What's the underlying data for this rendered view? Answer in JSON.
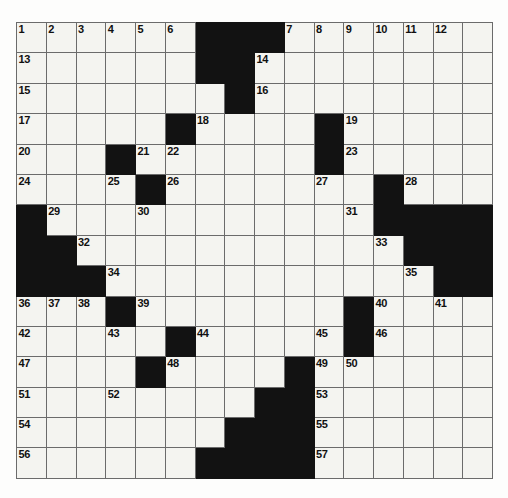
{
  "puzzle": {
    "title": "Crossword Grid",
    "columns": 16,
    "rows": 15,
    "colors": {
      "block": "#121212",
      "cell": "#f4f4f0",
      "grid_line": "#6b6b6b",
      "number_text": "#101010",
      "page_background": "#fdfdfc"
    },
    "numbers_visible": [
      1,
      2,
      3,
      4,
      5,
      6,
      7,
      8,
      9,
      10,
      11,
      12,
      13,
      14,
      15,
      16,
      17,
      18,
      19,
      20,
      21,
      22,
      23,
      24,
      25,
      26,
      27,
      28,
      29,
      30,
      31,
      32,
      33,
      34,
      35,
      36,
      37,
      38,
      39,
      40,
      41,
      42,
      43,
      44,
      45,
      46,
      47,
      48,
      49,
      50,
      51,
      52,
      53,
      54,
      55,
      56,
      57
    ],
    "grid": [
      [
        {
          "block": false,
          "num": "1"
        },
        {
          "block": false,
          "num": "2"
        },
        {
          "block": false,
          "num": "3"
        },
        {
          "block": false,
          "num": "4"
        },
        {
          "block": false,
          "num": "5"
        },
        {
          "block": false,
          "num": "6"
        },
        {
          "block": true,
          "num": ""
        },
        {
          "block": true,
          "num": ""
        },
        {
          "block": true,
          "num": ""
        },
        {
          "block": false,
          "num": "7"
        },
        {
          "block": false,
          "num": "8"
        },
        {
          "block": false,
          "num": "9"
        },
        {
          "block": false,
          "num": "10"
        },
        {
          "block": false,
          "num": "11"
        },
        {
          "block": false,
          "num": "12"
        },
        {
          "block": false,
          "num": ""
        }
      ],
      [
        {
          "block": false,
          "num": "13"
        },
        {
          "block": false,
          "num": ""
        },
        {
          "block": false,
          "num": ""
        },
        {
          "block": false,
          "num": ""
        },
        {
          "block": false,
          "num": ""
        },
        {
          "block": false,
          "num": ""
        },
        {
          "block": true,
          "num": ""
        },
        {
          "block": true,
          "num": ""
        },
        {
          "block": false,
          "num": "14"
        },
        {
          "block": false,
          "num": ""
        },
        {
          "block": false,
          "num": ""
        },
        {
          "block": false,
          "num": ""
        },
        {
          "block": false,
          "num": ""
        },
        {
          "block": false,
          "num": ""
        },
        {
          "block": false,
          "num": ""
        },
        {
          "block": false,
          "num": ""
        }
      ],
      [
        {
          "block": false,
          "num": "15"
        },
        {
          "block": false,
          "num": ""
        },
        {
          "block": false,
          "num": ""
        },
        {
          "block": false,
          "num": ""
        },
        {
          "block": false,
          "num": ""
        },
        {
          "block": false,
          "num": ""
        },
        {
          "block": false,
          "num": ""
        },
        {
          "block": true,
          "num": ""
        },
        {
          "block": false,
          "num": "16"
        },
        {
          "block": false,
          "num": ""
        },
        {
          "block": false,
          "num": ""
        },
        {
          "block": false,
          "num": ""
        },
        {
          "block": false,
          "num": ""
        },
        {
          "block": false,
          "num": ""
        },
        {
          "block": false,
          "num": ""
        },
        {
          "block": false,
          "num": ""
        }
      ],
      [
        {
          "block": false,
          "num": "17"
        },
        {
          "block": false,
          "num": ""
        },
        {
          "block": false,
          "num": ""
        },
        {
          "block": false,
          "num": ""
        },
        {
          "block": false,
          "num": ""
        },
        {
          "block": true,
          "num": ""
        },
        {
          "block": false,
          "num": "18"
        },
        {
          "block": false,
          "num": ""
        },
        {
          "block": false,
          "num": ""
        },
        {
          "block": false,
          "num": ""
        },
        {
          "block": true,
          "num": ""
        },
        {
          "block": false,
          "num": "19"
        },
        {
          "block": false,
          "num": ""
        },
        {
          "block": false,
          "num": ""
        },
        {
          "block": false,
          "num": ""
        },
        {
          "block": false,
          "num": ""
        }
      ],
      [
        {
          "block": false,
          "num": "20"
        },
        {
          "block": false,
          "num": ""
        },
        {
          "block": false,
          "num": ""
        },
        {
          "block": true,
          "num": ""
        },
        {
          "block": false,
          "num": "21"
        },
        {
          "block": false,
          "num": "22"
        },
        {
          "block": false,
          "num": ""
        },
        {
          "block": false,
          "num": ""
        },
        {
          "block": false,
          "num": ""
        },
        {
          "block": false,
          "num": ""
        },
        {
          "block": true,
          "num": ""
        },
        {
          "block": false,
          "num": "23"
        },
        {
          "block": false,
          "num": ""
        },
        {
          "block": false,
          "num": ""
        },
        {
          "block": false,
          "num": ""
        },
        {
          "block": false,
          "num": ""
        }
      ],
      [
        {
          "block": false,
          "num": "24"
        },
        {
          "block": false,
          "num": ""
        },
        {
          "block": false,
          "num": ""
        },
        {
          "block": false,
          "num": "25"
        },
        {
          "block": true,
          "num": ""
        },
        {
          "block": false,
          "num": "26"
        },
        {
          "block": false,
          "num": ""
        },
        {
          "block": false,
          "num": ""
        },
        {
          "block": false,
          "num": ""
        },
        {
          "block": false,
          "num": ""
        },
        {
          "block": false,
          "num": "27"
        },
        {
          "block": false,
          "num": ""
        },
        {
          "block": true,
          "num": ""
        },
        {
          "block": false,
          "num": "28"
        },
        {
          "block": false,
          "num": ""
        },
        {
          "block": false,
          "num": ""
        }
      ],
      [
        {
          "block": true,
          "num": ""
        },
        {
          "block": false,
          "num": "29"
        },
        {
          "block": false,
          "num": ""
        },
        {
          "block": false,
          "num": ""
        },
        {
          "block": false,
          "num": "30"
        },
        {
          "block": false,
          "num": ""
        },
        {
          "block": false,
          "num": ""
        },
        {
          "block": false,
          "num": ""
        },
        {
          "block": false,
          "num": ""
        },
        {
          "block": false,
          "num": ""
        },
        {
          "block": false,
          "num": ""
        },
        {
          "block": false,
          "num": "31"
        },
        {
          "block": true,
          "num": ""
        },
        {
          "block": true,
          "num": ""
        },
        {
          "block": true,
          "num": ""
        },
        {
          "block": true,
          "num": ""
        }
      ],
      [
        {
          "block": true,
          "num": ""
        },
        {
          "block": true,
          "num": ""
        },
        {
          "block": false,
          "num": "32"
        },
        {
          "block": false,
          "num": ""
        },
        {
          "block": false,
          "num": ""
        },
        {
          "block": false,
          "num": ""
        },
        {
          "block": false,
          "num": ""
        },
        {
          "block": false,
          "num": ""
        },
        {
          "block": false,
          "num": ""
        },
        {
          "block": false,
          "num": ""
        },
        {
          "block": false,
          "num": ""
        },
        {
          "block": false,
          "num": ""
        },
        {
          "block": false,
          "num": "33"
        },
        {
          "block": true,
          "num": ""
        },
        {
          "block": true,
          "num": ""
        },
        {
          "block": true,
          "num": ""
        }
      ],
      [
        {
          "block": true,
          "num": ""
        },
        {
          "block": true,
          "num": ""
        },
        {
          "block": true,
          "num": ""
        },
        {
          "block": false,
          "num": "34"
        },
        {
          "block": false,
          "num": ""
        },
        {
          "block": false,
          "num": ""
        },
        {
          "block": false,
          "num": ""
        },
        {
          "block": false,
          "num": ""
        },
        {
          "block": false,
          "num": ""
        },
        {
          "block": false,
          "num": ""
        },
        {
          "block": false,
          "num": ""
        },
        {
          "block": false,
          "num": ""
        },
        {
          "block": false,
          "num": ""
        },
        {
          "block": false,
          "num": "35"
        },
        {
          "block": true,
          "num": ""
        },
        {
          "block": true,
          "num": ""
        }
      ],
      [
        {
          "block": false,
          "num": "36"
        },
        {
          "block": false,
          "num": "37"
        },
        {
          "block": false,
          "num": "38"
        },
        {
          "block": true,
          "num": ""
        },
        {
          "block": false,
          "num": "39"
        },
        {
          "block": false,
          "num": ""
        },
        {
          "block": false,
          "num": ""
        },
        {
          "block": false,
          "num": ""
        },
        {
          "block": false,
          "num": ""
        },
        {
          "block": false,
          "num": ""
        },
        {
          "block": false,
          "num": ""
        },
        {
          "block": true,
          "num": ""
        },
        {
          "block": false,
          "num": "40"
        },
        {
          "block": false,
          "num": ""
        },
        {
          "block": false,
          "num": "41"
        },
        {
          "block": false,
          "num": ""
        }
      ],
      [
        {
          "block": false,
          "num": "42"
        },
        {
          "block": false,
          "num": ""
        },
        {
          "block": false,
          "num": ""
        },
        {
          "block": false,
          "num": "43"
        },
        {
          "block": false,
          "num": ""
        },
        {
          "block": true,
          "num": ""
        },
        {
          "block": false,
          "num": "44"
        },
        {
          "block": false,
          "num": ""
        },
        {
          "block": false,
          "num": ""
        },
        {
          "block": false,
          "num": ""
        },
        {
          "block": false,
          "num": "45"
        },
        {
          "block": true,
          "num": ""
        },
        {
          "block": false,
          "num": "46"
        },
        {
          "block": false,
          "num": ""
        },
        {
          "block": false,
          "num": ""
        },
        {
          "block": false,
          "num": ""
        }
      ],
      [
        {
          "block": false,
          "num": "47"
        },
        {
          "block": false,
          "num": ""
        },
        {
          "block": false,
          "num": ""
        },
        {
          "block": false,
          "num": ""
        },
        {
          "block": true,
          "num": ""
        },
        {
          "block": false,
          "num": "48"
        },
        {
          "block": false,
          "num": ""
        },
        {
          "block": false,
          "num": ""
        },
        {
          "block": false,
          "num": ""
        },
        {
          "block": true,
          "num": ""
        },
        {
          "block": false,
          "num": "49"
        },
        {
          "block": false,
          "num": "50"
        },
        {
          "block": false,
          "num": ""
        },
        {
          "block": false,
          "num": ""
        },
        {
          "block": false,
          "num": ""
        },
        {
          "block": false,
          "num": ""
        }
      ],
      [
        {
          "block": false,
          "num": "51"
        },
        {
          "block": false,
          "num": ""
        },
        {
          "block": false,
          "num": ""
        },
        {
          "block": false,
          "num": "52"
        },
        {
          "block": false,
          "num": ""
        },
        {
          "block": false,
          "num": ""
        },
        {
          "block": false,
          "num": ""
        },
        {
          "block": false,
          "num": ""
        },
        {
          "block": true,
          "num": ""
        },
        {
          "block": true,
          "num": ""
        },
        {
          "block": false,
          "num": "53"
        },
        {
          "block": false,
          "num": ""
        },
        {
          "block": false,
          "num": ""
        },
        {
          "block": false,
          "num": ""
        },
        {
          "block": false,
          "num": ""
        },
        {
          "block": false,
          "num": ""
        }
      ],
      [
        {
          "block": false,
          "num": "54"
        },
        {
          "block": false,
          "num": ""
        },
        {
          "block": false,
          "num": ""
        },
        {
          "block": false,
          "num": ""
        },
        {
          "block": false,
          "num": ""
        },
        {
          "block": false,
          "num": ""
        },
        {
          "block": false,
          "num": ""
        },
        {
          "block": true,
          "num": ""
        },
        {
          "block": true,
          "num": ""
        },
        {
          "block": true,
          "num": ""
        },
        {
          "block": false,
          "num": "55"
        },
        {
          "block": false,
          "num": ""
        },
        {
          "block": false,
          "num": ""
        },
        {
          "block": false,
          "num": ""
        },
        {
          "block": false,
          "num": ""
        },
        {
          "block": false,
          "num": ""
        }
      ],
      [
        {
          "block": false,
          "num": "56"
        },
        {
          "block": false,
          "num": ""
        },
        {
          "block": false,
          "num": ""
        },
        {
          "block": false,
          "num": ""
        },
        {
          "block": false,
          "num": ""
        },
        {
          "block": false,
          "num": ""
        },
        {
          "block": true,
          "num": ""
        },
        {
          "block": true,
          "num": ""
        },
        {
          "block": true,
          "num": ""
        },
        {
          "block": true,
          "num": ""
        },
        {
          "block": false,
          "num": "57"
        },
        {
          "block": false,
          "num": ""
        },
        {
          "block": false,
          "num": ""
        },
        {
          "block": false,
          "num": ""
        },
        {
          "block": false,
          "num": ""
        },
        {
          "block": false,
          "num": ""
        }
      ]
    ]
  }
}
